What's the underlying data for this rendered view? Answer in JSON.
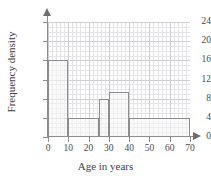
{
  "chart_data": {
    "type": "bar",
    "title": "",
    "xlabel": "Age in years",
    "ylabel": "Frequency density",
    "xlim": [
      0,
      70
    ],
    "ylim": [
      0,
      24
    ],
    "grid": true,
    "legend": null,
    "xticks": [
      0,
      10,
      20,
      30,
      40,
      50,
      60,
      70
    ],
    "yticks": [
      0,
      4,
      8,
      12,
      16,
      20,
      24
    ],
    "xtick_labels": [
      "0",
      "10",
      "20",
      "30",
      "40",
      "50",
      "60",
      "70"
    ],
    "ytick_labels": [
      "0",
      "4",
      "8",
      "12",
      "16",
      "20",
      "24"
    ],
    "bins": [
      {
        "label": "0-10",
        "start": 0,
        "end": 10,
        "value": 16
      },
      {
        "label": "10-25",
        "start": 10,
        "end": 25,
        "value": 4
      },
      {
        "label": "25-30",
        "start": 25,
        "end": 30,
        "value": 8
      },
      {
        "label": "30-40",
        "start": 30,
        "end": 40,
        "value": 9.3
      },
      {
        "label": "40-70",
        "start": 40,
        "end": 70,
        "value": 4
      }
    ],
    "colors": {
      "bar_fill": "#f5f5f5",
      "bar_edge": "#8d8d90",
      "axis": "#8d8d90",
      "grid_minor": "#e4e4e6",
      "grid_major": "#cfcfd2",
      "text": "#3f3f3f",
      "background": "#ffffff"
    }
  }
}
